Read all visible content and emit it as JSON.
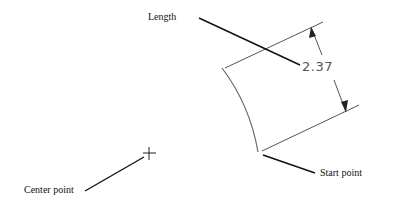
{
  "diagram": {
    "labels": {
      "length": "Length",
      "start_point": "Start point",
      "center_point": "Center point"
    },
    "dimension": {
      "value": "2.37"
    },
    "colors": {
      "leader": "#111111",
      "geometry": "#555555",
      "background": "#ffffff"
    }
  }
}
